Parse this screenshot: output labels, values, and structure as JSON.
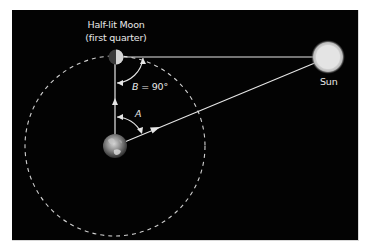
{
  "figure": {
    "background": "#ffffff",
    "panel_color": "#030303",
    "line_color": "#e6e6e6"
  },
  "labels": {
    "moon_title": "Half-lit Moon",
    "moon_subtitle": "(first quarter)",
    "sun": "Sun",
    "angle_b_var": "B",
    "angle_b_value": "= 90°",
    "angle_a": "A"
  },
  "objects": [
    {
      "name": "Earth",
      "icon": "earth-icon"
    },
    {
      "name": "Moon",
      "icon": "half-moon-icon"
    },
    {
      "name": "Sun",
      "icon": "sun-icon"
    }
  ],
  "geometry": {
    "orbit": "dashed circular lunar orbit centered on Earth",
    "lines": [
      "Earth to Moon (vertical)",
      "Moon to Sun (horizontal)",
      "Earth to Sun (diagonal)"
    ],
    "angles": [
      {
        "label": "A",
        "between": "Earth-Moon and Earth-Sun"
      },
      {
        "label": "B",
        "value": "90°",
        "between": "Moon-Earth and Moon-Sun"
      }
    ]
  }
}
